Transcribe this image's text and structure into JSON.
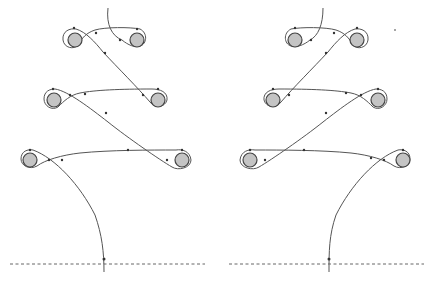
{
  "figure": {
    "colors": {
      "peg_fill": "#c4c4c4",
      "peg_stroke": "#444444",
      "path_stroke": "#555555",
      "baseline": "#555555",
      "background": "#ffffff"
    },
    "panels": [
      {
        "id": "left",
        "pegs": [
          {
            "row": 1,
            "side": "left",
            "cx": 75,
            "cy": 40
          },
          {
            "row": 1,
            "side": "right",
            "cx": 137,
            "cy": 40
          },
          {
            "row": 2,
            "side": "left",
            "cx": 54,
            "cy": 100
          },
          {
            "row": 2,
            "side": "right",
            "cx": 158,
            "cy": 100
          },
          {
            "row": 3,
            "side": "left",
            "cx": 30,
            "cy": 160
          },
          {
            "row": 3,
            "side": "right",
            "cx": 182,
            "cy": 160
          }
        ],
        "baseline": {
          "x1": 10,
          "x2": 205,
          "y": 264
        }
      },
      {
        "id": "right",
        "pegs": [
          {
            "row": 1,
            "side": "left",
            "cx": 295,
            "cy": 40
          },
          {
            "row": 1,
            "side": "right",
            "cx": 357,
            "cy": 40
          },
          {
            "row": 2,
            "side": "left",
            "cx": 273,
            "cy": 100
          },
          {
            "row": 2,
            "side": "right",
            "cx": 378,
            "cy": 100
          },
          {
            "row": 3,
            "side": "left",
            "cx": 250,
            "cy": 160
          },
          {
            "row": 3,
            "side": "right",
            "cx": 403,
            "cy": 160
          }
        ],
        "baseline": {
          "x1": 229,
          "x2": 424,
          "y": 264
        }
      }
    ]
  }
}
